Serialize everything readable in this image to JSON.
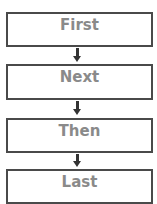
{
  "flow": {
    "steps": [
      {
        "label": "First"
      },
      {
        "label": "Next"
      },
      {
        "label": "Then"
      },
      {
        "label": "Last"
      }
    ],
    "colors": {
      "border": "#4a4a4a",
      "text": "#8a8a8a",
      "arrow": "#333333"
    }
  }
}
